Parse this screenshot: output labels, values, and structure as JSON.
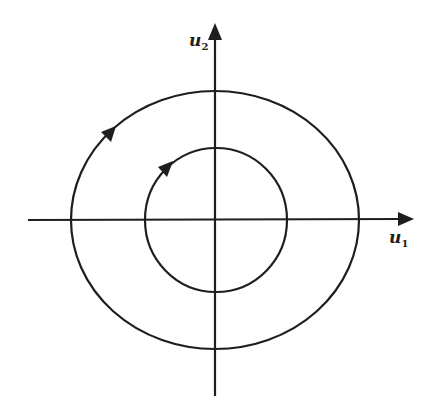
{
  "diagram": {
    "type": "phase-portrait",
    "axes": {
      "horizontal": {
        "label_base": "u",
        "label_sub": "1"
      },
      "vertical": {
        "label_base": "u",
        "label_sub": "2"
      }
    },
    "orbits": [
      {
        "name": "outer",
        "cx": 215,
        "cy": 220,
        "rx": 144,
        "ry": 129,
        "direction": "counterclockwise"
      },
      {
        "name": "inner",
        "cx": 216,
        "cy": 220,
        "rx": 71,
        "ry": 72,
        "direction": "counterclockwise"
      }
    ],
    "colors": {
      "stroke": "#1e1e1e",
      "background": "#ffffff"
    }
  }
}
